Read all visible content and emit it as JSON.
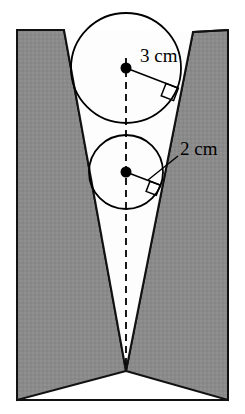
{
  "figure": {
    "background_color": "#ffffff",
    "border_color": "#5a5a5a",
    "block_fill_color": "#8a8a8a",
    "block_stroke_color": "#111111",
    "notch_fill_color": "#fdfdfd",
    "line_color": "#000000",
    "dot_color": "#000000"
  },
  "labels": {
    "large_circle_radius": "3 cm",
    "small_circle_radius": "2 cm"
  },
  "geometry": {
    "canvas_width": 245,
    "canvas_height": 414,
    "left_block": {
      "top_left_x": 17,
      "top_left_y": 30,
      "top_right_x": 64,
      "top_right_y": 30,
      "bottom_y": 400
    },
    "right_block": {
      "top_left_x": 193,
      "top_left_y": 32,
      "top_right_x": 228,
      "top_right_y": 30,
      "bottom_y": 400
    },
    "notch_apex_x": 126,
    "notch_apex_y": 371,
    "large_circle": {
      "cx": 126,
      "cy": 68,
      "r": 55
    },
    "small_circle": {
      "cx": 126,
      "cy": 172,
      "r": 37
    },
    "center_dot_radius": 5.5,
    "axis_dash_pattern": "7,5"
  }
}
